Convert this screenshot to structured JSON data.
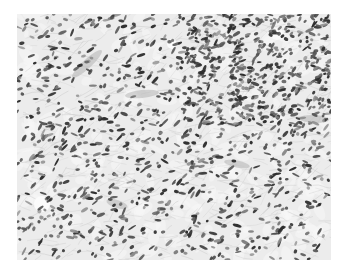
{
  "image": {
    "kind": "histology-micrograph",
    "description": "Grayscale photomicrograph of spindle-cell tissue with densely scattered oval/elongated dark nuclei in a pale fibrillary stroma",
    "frame": {
      "x": 17,
      "y": 14,
      "width": 314,
      "height": 246
    },
    "colors": {
      "page_background": "#ffffff",
      "stroma": "#ececec",
      "stroma_light": "#f7f7f7",
      "fibers": "#c8c8c8",
      "nucleus_dark": "#2e2e2e",
      "nucleus_mid": "#5a5a5a",
      "nucleus_light": "#8a8a8a",
      "vessel": "#b4b4b4"
    },
    "render": {
      "seed": 7,
      "nucleus_count": 1400,
      "fiber_count": 700,
      "pale_fascicles": [
        {
          "x": 70,
          "y": 50,
          "len": 40,
          "w": 9,
          "angle": -0.75
        },
        {
          "x": 125,
          "y": 80,
          "len": 34,
          "w": 8,
          "angle": -0.1
        },
        {
          "x": 297,
          "y": 105,
          "len": 30,
          "w": 8,
          "angle": 0.05
        },
        {
          "x": 220,
          "y": 150,
          "len": 26,
          "w": 7,
          "angle": 0.2
        },
        {
          "x": 100,
          "y": 190,
          "len": 22,
          "w": 8,
          "angle": 0.3
        }
      ],
      "clear_spaces": [
        {
          "x": 25,
          "y": 190,
          "r": 8
        },
        {
          "x": 155,
          "y": 30,
          "r": 5
        },
        {
          "x": 260,
          "y": 20,
          "r": 6
        }
      ]
    }
  }
}
